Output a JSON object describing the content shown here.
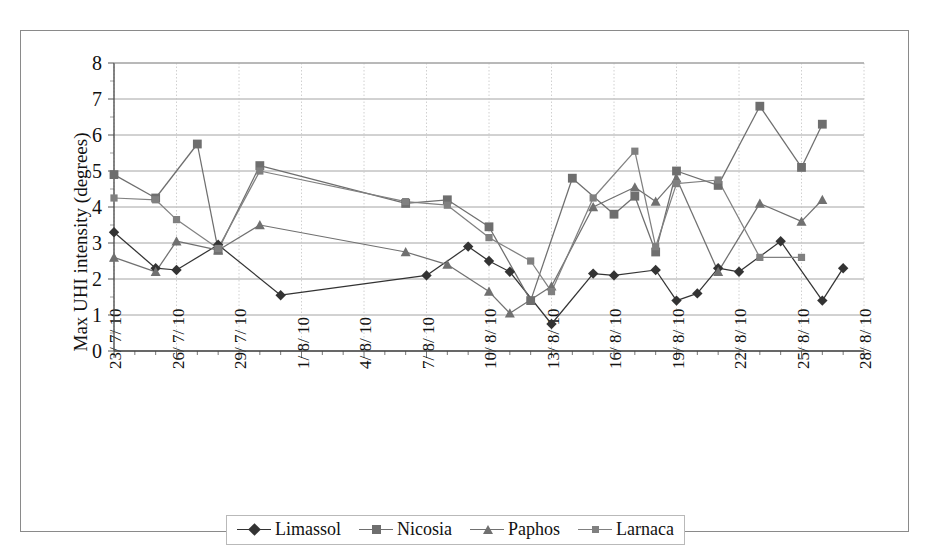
{
  "axis": {
    "ylabel": "Max UHI intensity (degrees)",
    "yticks": [
      "0",
      "1",
      "2",
      "3",
      "4",
      "5",
      "6",
      "7",
      "8"
    ],
    "xticklabels": [
      "23/ 7/ 10",
      "26/ 7/ 10",
      "29/ 7/ 10",
      "1/ 8/ 10",
      "4/ 8/ 10",
      "7/ 8/ 10",
      "10/ 8/ 10",
      "13/ 8/ 10",
      "16/ 8/ 10",
      "19/ 8/ 10",
      "22/ 8/ 10",
      "25/ 8/ 10",
      "28/ 8/ 10"
    ]
  },
  "legend": {
    "items": [
      {
        "label": "Limassol",
        "marker": "diamond",
        "color": "#333333"
      },
      {
        "label": "Nicosia",
        "marker": "square",
        "color": "#6e6e6e"
      },
      {
        "label": "Paphos",
        "marker": "triangle",
        "color": "#707070"
      },
      {
        "label": "Larnaca",
        "marker": "square-small",
        "color": "#808080"
      }
    ]
  },
  "chart_data": {
    "type": "line",
    "title": "",
    "xlabel": "",
    "ylabel": "Max UHI intensity (degrees)",
    "ylim": [
      0,
      8
    ],
    "ytick_step": 1,
    "grid": true,
    "legend_position": "bottom",
    "x": [
      "23/7/10",
      "24/7/10",
      "25/7/10",
      "26/7/10",
      "27/7/10",
      "28/7/10",
      "29/7/10",
      "30/7/10",
      "31/7/10",
      "1/8/10",
      "2/8/10",
      "3/8/10",
      "4/8/10",
      "5/8/10",
      "6/8/10",
      "7/8/10",
      "8/8/10",
      "9/8/10",
      "10/8/10",
      "11/8/10",
      "12/8/10",
      "13/8/10",
      "14/8/10",
      "15/8/10",
      "16/8/10",
      "17/8/10",
      "18/8/10",
      "19/8/10",
      "20/8/10",
      "21/8/10",
      "22/8/10",
      "23/8/10",
      "24/8/10",
      "25/8/10",
      "26/8/10",
      "27/8/10",
      "28/8/10"
    ],
    "series": [
      {
        "name": "Limassol",
        "marker": "diamond",
        "color": "#333333",
        "values": [
          3.3,
          null,
          2.3,
          2.25,
          null,
          2.95,
          null,
          null,
          1.55,
          null,
          null,
          null,
          null,
          null,
          null,
          2.1,
          null,
          2.9,
          2.5,
          2.2,
          null,
          0.75,
          null,
          2.15,
          2.1,
          null,
          2.25,
          1.4,
          1.6,
          2.3,
          2.2,
          null,
          3.05,
          null,
          1.4,
          2.3,
          null
        ]
      },
      {
        "name": "Nicosia",
        "marker": "square",
        "color": "#6e6e6e",
        "values": [
          4.9,
          null,
          4.25,
          null,
          5.75,
          2.8,
          null,
          5.15,
          null,
          null,
          null,
          null,
          null,
          null,
          4.1,
          null,
          4.2,
          null,
          3.45,
          null,
          1.4,
          null,
          4.8,
          null,
          3.8,
          4.3,
          2.75,
          5.0,
          null,
          4.6,
          null,
          6.8,
          null,
          5.1,
          6.3,
          null,
          null
        ]
      },
      {
        "name": "Paphos",
        "marker": "triangle",
        "color": "#707070",
        "values": [
          2.6,
          null,
          2.2,
          3.05,
          null,
          2.8,
          null,
          3.5,
          null,
          null,
          null,
          null,
          null,
          null,
          2.75,
          null,
          2.4,
          null,
          1.65,
          1.05,
          null,
          1.8,
          null,
          4.0,
          null,
          4.55,
          4.15,
          4.8,
          null,
          2.2,
          null,
          4.1,
          null,
          3.6,
          4.2,
          null,
          null
        ]
      },
      {
        "name": "Larnaca",
        "marker": "square-small",
        "color": "#808080",
        "values": [
          4.25,
          null,
          4.2,
          3.65,
          null,
          2.85,
          null,
          5.0,
          null,
          null,
          null,
          null,
          null,
          null,
          4.15,
          null,
          4.05,
          null,
          3.15,
          null,
          2.5,
          1.65,
          null,
          4.25,
          null,
          5.55,
          2.9,
          4.65,
          null,
          4.75,
          null,
          2.6,
          null,
          2.6,
          null,
          null,
          null
        ]
      }
    ]
  }
}
